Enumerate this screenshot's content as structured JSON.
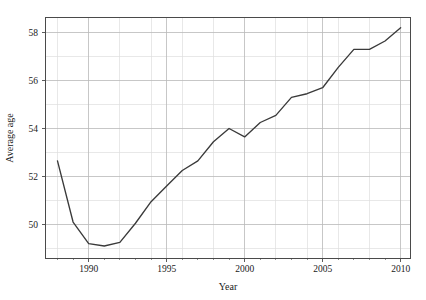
{
  "chart_data": {
    "type": "line",
    "title": "",
    "subtitle": "",
    "xlabel": "Year",
    "ylabel": "Average age",
    "xlim": [
      1987.2,
      2010.6
    ],
    "ylim": [
      48.6,
      58.65
    ],
    "grid": true,
    "legend": null,
    "legend_position": "none",
    "line_color": "#3a3a3a",
    "grid_color_major": "#b9b9b9",
    "grid_color_minor": "#dedede",
    "axis_color": "#4a4a4a",
    "background_color": "#ffffff",
    "x_major_ticks": [
      1990,
      1995,
      2000,
      2005,
      2010
    ],
    "x_major_tick_labels": [
      "1990",
      "1995",
      "2000",
      "2005",
      "2010"
    ],
    "x_minor_ticks": [
      1988,
      1989,
      1991,
      1992,
      1993,
      1994,
      1996,
      1997,
      1998,
      1999,
      2001,
      2002,
      2003,
      2004,
      2006,
      2007,
      2008,
      2009
    ],
    "x_gridlines": [
      1988,
      1990,
      1992,
      1994,
      1996,
      1998,
      2000,
      2002,
      2004,
      2006,
      2008,
      2010
    ],
    "y_major_ticks": [
      50,
      52,
      54,
      56,
      58
    ],
    "y_major_tick_labels": [
      "50",
      "52",
      "54",
      "56",
      "58"
    ],
    "y_minor_gridlines": [
      49,
      51,
      53,
      55,
      57
    ],
    "x": [
      1988,
      1989,
      1990,
      1991,
      1992,
      1993,
      1994,
      1995,
      1996,
      1997,
      1998,
      1999,
      2000,
      2001,
      2002,
      2003,
      2004,
      2005,
      2006,
      2007,
      2008,
      2009,
      2010
    ],
    "values": [
      52.65,
      50.1,
      49.2,
      49.1,
      49.25,
      50.05,
      50.95,
      51.6,
      52.25,
      52.65,
      53.45,
      54.0,
      53.65,
      54.25,
      54.55,
      55.3,
      55.45,
      55.7,
      56.55,
      57.3,
      57.3,
      57.65,
      58.2
    ],
    "series": [
      {
        "name": "Average age",
        "x": [
          1988,
          1989,
          1990,
          1991,
          1992,
          1993,
          1994,
          1995,
          1996,
          1997,
          1998,
          1999,
          2000,
          2001,
          2002,
          2003,
          2004,
          2005,
          2006,
          2007,
          2008,
          2009,
          2010
        ],
        "values": [
          52.65,
          50.1,
          49.2,
          49.1,
          49.25,
          50.05,
          50.95,
          51.6,
          52.25,
          52.65,
          53.45,
          54.0,
          53.65,
          54.25,
          54.55,
          55.3,
          55.45,
          55.7,
          56.55,
          57.3,
          57.3,
          57.65,
          58.2
        ]
      }
    ]
  },
  "plot": {
    "left": 45,
    "right": 410,
    "top": 17,
    "bottom": 258
  }
}
